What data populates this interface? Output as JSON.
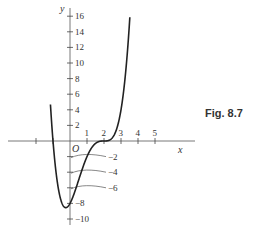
{
  "figure_label": "Fig. 8.7",
  "chart_data": {
    "type": "line",
    "title": "",
    "function": "y = (x - 2)^3 (x + 1)",
    "xlabel": "x",
    "ylabel": "y",
    "origin_label": "O",
    "xlim": [
      -3,
      6
    ],
    "ylim": [
      -10,
      16
    ],
    "x_ticks": [
      -2,
      -1,
      1,
      2,
      3,
      4,
      5
    ],
    "x_tick_labels": [
      "1",
      "2",
      "3",
      "4",
      "5"
    ],
    "y_ticks": [
      -10,
      -8,
      -6,
      -4,
      -2,
      2,
      4,
      6,
      8,
      10,
      12,
      14,
      16
    ],
    "y_tick_labels": [
      "16",
      "14",
      "12",
      "10",
      "8",
      "6",
      "4",
      "2",
      "-2",
      "-4",
      "-6",
      "-8",
      "-10"
    ],
    "grid": false,
    "annotations": [
      "-2",
      "-4",
      "-6"
    ],
    "series": [
      {
        "name": "curve",
        "x": [
          -1.1,
          -1.0,
          -0.75,
          -0.5,
          -0.25,
          0,
          0.5,
          1,
          1.5,
          2,
          2.5,
          3,
          3.25,
          3.5
        ],
        "y": [
          3.2,
          0,
          -5.36,
          -7.81,
          -8.54,
          -8,
          -5.06,
          -2,
          -0.31,
          0,
          0.44,
          4,
          8.54,
          15.19
        ]
      }
    ]
  }
}
